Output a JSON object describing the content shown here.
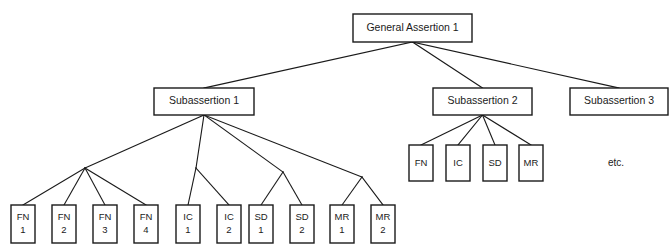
{
  "diagram": {
    "type": "tree-hierarchy",
    "root": {
      "id": "general-assertion-1",
      "label": "General Assertion 1",
      "box": {
        "x": 353,
        "y": 14,
        "w": 119,
        "h": 28
      }
    },
    "level2": [
      {
        "id": "subassertion-1",
        "label": "Subassertion 1",
        "box": {
          "x": 154,
          "y": 88,
          "w": 100,
          "h": 27
        }
      },
      {
        "id": "subassertion-2",
        "label": "Subassertion 2",
        "box": {
          "x": 433,
          "y": 88,
          "w": 99,
          "h": 27
        }
      },
      {
        "id": "subassertion-3",
        "label": "Subassertion 3",
        "box": {
          "x": 570,
          "y": 88,
          "w": 98,
          "h": 27
        }
      }
    ],
    "subassertion2_children": [
      {
        "id": "s2-fn",
        "label": "FN",
        "box": {
          "x": 409,
          "y": 145,
          "w": 24,
          "h": 36
        }
      },
      {
        "id": "s2-ic",
        "label": "IC",
        "box": {
          "x": 446,
          "y": 145,
          "w": 24,
          "h": 36
        }
      },
      {
        "id": "s2-sd",
        "label": "SD",
        "box": {
          "x": 483,
          "y": 145,
          "w": 24,
          "h": 36
        }
      },
      {
        "id": "s2-mr",
        "label": "MR",
        "box": {
          "x": 519,
          "y": 145,
          "w": 24,
          "h": 36
        }
      }
    ],
    "subassertion1_groups": [
      {
        "id": "group-fn",
        "junction": {
          "x": 85,
          "y": 168
        },
        "children": [
          {
            "id": "fn-1",
            "line1": "FN",
            "line2": "1",
            "box": {
              "x": 11,
              "y": 205,
              "w": 24,
              "h": 38
            }
          },
          {
            "id": "fn-2",
            "line1": "FN",
            "line2": "2",
            "box": {
              "x": 52,
              "y": 205,
              "w": 24,
              "h": 38
            }
          },
          {
            "id": "fn-3",
            "line1": "FN",
            "line2": "3",
            "box": {
              "x": 93,
              "y": 205,
              "w": 24,
              "h": 38
            }
          },
          {
            "id": "fn-4",
            "line1": "FN",
            "line2": "4",
            "box": {
              "x": 134,
              "y": 205,
              "w": 24,
              "h": 38
            }
          }
        ]
      },
      {
        "id": "group-ic",
        "junction": {
          "x": 196,
          "y": 168
        },
        "children": [
          {
            "id": "ic-1",
            "line1": "IC",
            "line2": "1",
            "box": {
              "x": 176,
              "y": 205,
              "w": 24,
              "h": 38
            }
          },
          {
            "id": "ic-2",
            "line1": "IC",
            "line2": "2",
            "box": {
              "x": 217,
              "y": 205,
              "w": 24,
              "h": 38
            }
          }
        ]
      },
      {
        "id": "group-sd",
        "junction": {
          "x": 283,
          "y": 172
        },
        "children": [
          {
            "id": "sd-1",
            "line1": "SD",
            "line2": "1",
            "box": {
              "x": 249,
              "y": 205,
              "w": 24,
              "h": 38
            }
          },
          {
            "id": "sd-2",
            "line1": "SD",
            "line2": "2",
            "box": {
              "x": 290,
              "y": 205,
              "w": 24,
              "h": 38
            }
          }
        ]
      },
      {
        "id": "group-mr",
        "junction": {
          "x": 362,
          "y": 177
        },
        "children": [
          {
            "id": "mr-1",
            "line1": "MR",
            "line2": "1",
            "box": {
              "x": 330,
              "y": 205,
              "w": 24,
              "h": 38
            }
          },
          {
            "id": "mr-2",
            "line1": "MR",
            "line2": "2",
            "box": {
              "x": 371,
              "y": 205,
              "w": 24,
              "h": 38
            }
          }
        ]
      }
    ],
    "annotations": [
      {
        "id": "etc-note",
        "label": "etc.",
        "x": 616,
        "y": 163
      }
    ],
    "colors": {
      "stroke": "#1a1a1a",
      "fill": "#ffffff",
      "background": "#ffffff",
      "text": "#1a1a1a"
    }
  }
}
